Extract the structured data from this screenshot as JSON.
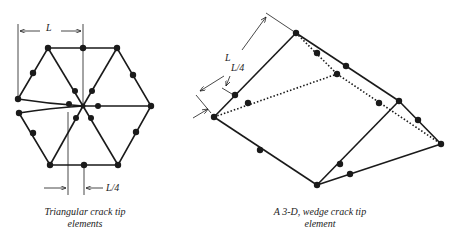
{
  "figures": [
    {
      "id": "triangular",
      "caption_line1": "Triangular crack tip",
      "caption_line2": "elements",
      "dim_L": "L",
      "dim_L4": "L/4"
    },
    {
      "id": "wedge",
      "caption_line1": "A 3-D, wedge crack tip",
      "caption_line2": "element",
      "dim_L": "L",
      "dim_L4": "L/4"
    }
  ],
  "colors": {
    "line": "#1a1a1a",
    "background": "#ffffff"
  }
}
